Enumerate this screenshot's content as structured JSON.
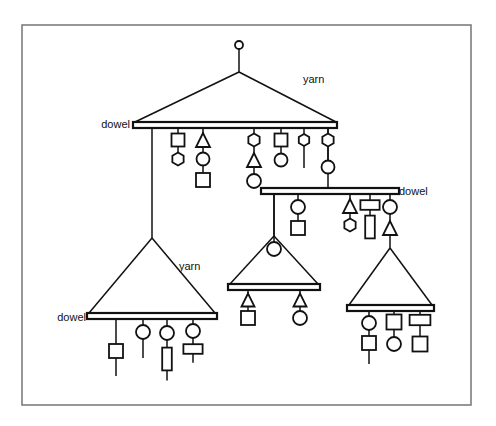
{
  "figure": {
    "background_color": "#ffffff",
    "line_color": "#111111",
    "frame_color": "#7d7d7d",
    "frame": {
      "x": 22,
      "y": 25,
      "width": 449,
      "height": 380
    }
  },
  "labels": [
    {
      "id": "label-yarn-top",
      "text": "yarn",
      "x": 303,
      "y": 80,
      "anchor": "start"
    },
    {
      "id": "label-dowel-top",
      "text": "dowel",
      "x": 130,
      "y": 125,
      "anchor": "end"
    },
    {
      "id": "label-dowel-right",
      "text": "dowel",
      "x": 399,
      "y": 192,
      "anchor": "start"
    },
    {
      "id": "label-yarn-left",
      "text": "yarn",
      "x": 179,
      "y": 267,
      "anchor": "start"
    },
    {
      "id": "label-dowel-left",
      "text": "dowel",
      "x": 86,
      "y": 318,
      "anchor": "end"
    }
  ],
  "mobiles": [
    {
      "id": "mobile-top",
      "name": "top-mobile",
      "hanger_knob": {
        "cx": 239,
        "cy": 45,
        "r": 4
      },
      "hanger_stem": {
        "x1": 239,
        "y1": 49,
        "x2": 239,
        "y2": 72
      },
      "yarn_left": {
        "x1": 239,
        "y1": 72,
        "x2": 135,
        "y2": 122
      },
      "yarn_right": {
        "x1": 239,
        "y1": 72,
        "x2": 336,
        "y2": 122
      },
      "dowel": {
        "x": 133,
        "y": 122,
        "width": 204,
        "height": 6
      }
    },
    {
      "id": "mobile-right",
      "name": "right-mobile",
      "suspension": {
        "x1": 328,
        "y1": 128,
        "x2": 328,
        "y2": 188
      },
      "dowel": {
        "x": 261,
        "y": 188,
        "width": 138,
        "height": 6
      }
    },
    {
      "id": "mobile-middle",
      "name": "middle-mobile",
      "suspension": {
        "x1": 274,
        "y1": 194,
        "x2": 274,
        "y2": 236
      },
      "yarn_left": {
        "x1": 274,
        "y1": 236,
        "x2": 230,
        "y2": 284
      },
      "yarn_right": {
        "x1": 274,
        "y1": 236,
        "x2": 318,
        "y2": 284
      },
      "dowel": {
        "x": 228,
        "y": 284,
        "width": 92,
        "height": 6
      }
    },
    {
      "id": "mobile-bottom-left",
      "name": "bottom-left-mobile",
      "suspension": {
        "x1": 152,
        "y1": 128,
        "x2": 152,
        "y2": 238
      },
      "yarn_left": {
        "x1": 152,
        "y1": 238,
        "x2": 89,
        "y2": 313
      },
      "yarn_right": {
        "x1": 152,
        "y1": 238,
        "x2": 215,
        "y2": 313
      },
      "dowel": {
        "x": 87,
        "y": 313,
        "width": 130,
        "height": 6
      }
    },
    {
      "id": "mobile-bottom-right",
      "name": "bottom-right-mobile",
      "suspension": {
        "x1": 390,
        "y1": 228,
        "x2": 390,
        "y2": 248
      },
      "yarn_left": {
        "x1": 390,
        "y1": 248,
        "x2": 349,
        "y2": 305
      },
      "yarn_right": {
        "x1": 390,
        "y1": 248,
        "x2": 432,
        "y2": 305
      },
      "dowel": {
        "x": 347,
        "y": 305,
        "width": 87,
        "height": 6
      }
    }
  ],
  "hangers": [
    {
      "id": "h-top-1",
      "mobile": "mobile-top",
      "x": 178,
      "top": 128,
      "shapes": [
        {
          "kind": "square",
          "cy": 140,
          "size": 13
        },
        {
          "kind": "hexagon",
          "cy": 159,
          "size": 13
        }
      ],
      "tail": 0
    },
    {
      "id": "h-top-2",
      "mobile": "mobile-top",
      "x": 203,
      "top": 128,
      "shapes": [
        {
          "kind": "triangle",
          "cy": 140,
          "size": 14
        },
        {
          "kind": "circle",
          "cy": 159,
          "size": 13
        },
        {
          "kind": "square",
          "cy": 180,
          "size": 14
        }
      ],
      "tail": 0
    },
    {
      "id": "h-top-3",
      "mobile": "mobile-top",
      "x": 254,
      "top": 128,
      "shapes": [
        {
          "kind": "hexagon",
          "cy": 140,
          "size": 13
        },
        {
          "kind": "triangle",
          "cy": 160,
          "size": 14
        },
        {
          "kind": "circle",
          "cy": 181,
          "size": 14
        }
      ],
      "tail": 0
    },
    {
      "id": "h-top-4",
      "mobile": "mobile-top",
      "x": 281,
      "top": 128,
      "shapes": [
        {
          "kind": "square",
          "cy": 140,
          "size": 13
        },
        {
          "kind": "circle",
          "cy": 160,
          "size": 13
        }
      ],
      "tail": 0
    },
    {
      "id": "h-top-5",
      "mobile": "mobile-top",
      "x": 304,
      "top": 128,
      "shapes": [
        {
          "kind": "hexagon",
          "cy": 140,
          "size": 12
        }
      ],
      "tail": 22
    },
    {
      "id": "h-top-6",
      "mobile": "mobile-top",
      "x": 328,
      "top": 128,
      "shapes": [
        {
          "kind": "hexagon",
          "cy": 140,
          "size": 13
        },
        {
          "kind": "circle",
          "cy": 167,
          "size": 13
        }
      ],
      "tail": 0
    },
    {
      "id": "h-right-1",
      "mobile": "mobile-right",
      "x": 274,
      "top": 194,
      "shapes": [],
      "tail": 42
    },
    {
      "id": "h-right-2",
      "mobile": "mobile-right",
      "x": 298,
      "top": 194,
      "shapes": [
        {
          "kind": "circle",
          "cy": 207,
          "size": 14
        },
        {
          "kind": "square",
          "cy": 228,
          "size": 14
        }
      ],
      "tail": 0
    },
    {
      "id": "h-right-3",
      "mobile": "mobile-right",
      "x": 350,
      "top": 194,
      "shapes": [
        {
          "kind": "triangle",
          "cy": 206,
          "size": 14
        },
        {
          "kind": "hexagon",
          "cy": 225,
          "size": 13
        }
      ],
      "tail": 0
    },
    {
      "id": "h-right-4",
      "mobile": "mobile-right",
      "x": 370,
      "top": 194,
      "shapes": [
        {
          "kind": "rect-wide",
          "cy": 205,
          "size": 12
        },
        {
          "kind": "rect-tall",
          "cy": 227,
          "size": 12
        }
      ],
      "tail": 0
    },
    {
      "id": "h-right-5",
      "mobile": "mobile-right",
      "x": 390,
      "top": 194,
      "shapes": [
        {
          "kind": "circle",
          "cy": 207,
          "size": 14
        },
        {
          "kind": "triangle",
          "cy": 228,
          "size": 14
        }
      ],
      "tail": 0
    },
    {
      "id": "h-middle-1",
      "mobile": "mobile-middle",
      "x": 274,
      "top": 236,
      "shapes": [
        {
          "kind": "circle",
          "cy": 249,
          "size": 14
        }
      ],
      "tail": 0
    },
    {
      "id": "h-middle-2",
      "mobile": "mobile-middle",
      "x": 248,
      "top": 290,
      "shapes": [
        {
          "kind": "triangle",
          "cy": 300,
          "size": 13
        },
        {
          "kind": "square",
          "cy": 318,
          "size": 14
        }
      ],
      "tail": 0
    },
    {
      "id": "h-middle-3",
      "mobile": "mobile-middle",
      "x": 300,
      "top": 290,
      "shapes": [
        {
          "kind": "triangle",
          "cy": 300,
          "size": 13
        },
        {
          "kind": "circle",
          "cy": 318,
          "size": 14
        }
      ],
      "tail": 0
    },
    {
      "id": "h-bl-1",
      "mobile": "mobile-bottom-left",
      "x": 116,
      "top": 319,
      "shapes": [
        {
          "kind": "square",
          "cy": 351,
          "size": 14
        }
      ],
      "tail": 18
    },
    {
      "id": "h-bl-2",
      "mobile": "mobile-bottom-left",
      "x": 143,
      "top": 319,
      "shapes": [
        {
          "kind": "circle",
          "cy": 332,
          "size": 14
        }
      ],
      "tail": 19
    },
    {
      "id": "h-bl-3",
      "mobile": "mobile-bottom-left",
      "x": 167,
      "top": 319,
      "shapes": [
        {
          "kind": "circle",
          "cy": 333,
          "size": 14
        },
        {
          "kind": "rect-tall",
          "cy": 359,
          "size": 12
        }
      ],
      "tail": 10
    },
    {
      "id": "h-bl-4",
      "mobile": "mobile-bottom-left",
      "x": 193,
      "top": 319,
      "shapes": [
        {
          "kind": "circle",
          "cy": 331,
          "size": 14
        },
        {
          "kind": "rect-wide",
          "cy": 349,
          "size": 12
        }
      ],
      "tail": 9
    },
    {
      "id": "h-br-1",
      "mobile": "mobile-bottom-right",
      "x": 369,
      "top": 311,
      "shapes": [
        {
          "kind": "circle",
          "cy": 323,
          "size": 14
        },
        {
          "kind": "square",
          "cy": 343,
          "size": 14
        }
      ],
      "tail": 14
    },
    {
      "id": "h-br-2",
      "mobile": "mobile-bottom-right",
      "x": 394,
      "top": 311,
      "shapes": [
        {
          "kind": "square",
          "cy": 322,
          "size": 15
        },
        {
          "kind": "circle",
          "cy": 344,
          "size": 14
        }
      ],
      "tail": 0
    },
    {
      "id": "h-br-3",
      "mobile": "mobile-bottom-right",
      "x": 420,
      "top": 311,
      "shapes": [
        {
          "kind": "rect-wide",
          "cy": 320,
          "size": 13
        },
        {
          "kind": "square",
          "cy": 344,
          "size": 15
        }
      ],
      "tail": 0
    }
  ]
}
